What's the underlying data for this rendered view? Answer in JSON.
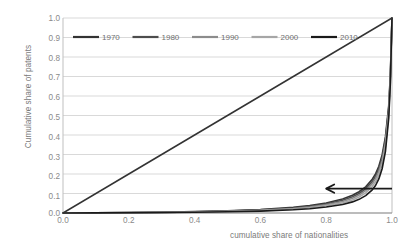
{
  "chart_data": {
    "type": "line",
    "title": "",
    "subtitle": "",
    "xlabel": "cumulative share of nationalities",
    "ylabel": "Cumulative share of patents",
    "xlim": [
      0.0,
      1.0
    ],
    "ylim": [
      0.0,
      1.0
    ],
    "xticks": [
      "0.0",
      "0.2",
      "0.4",
      "0.6",
      "0.8",
      "1.0"
    ],
    "xtick_values": [
      0.0,
      0.2,
      0.4,
      0.6,
      0.8,
      1.0
    ],
    "yticks": [
      "0.0",
      "0.1",
      "0.2",
      "0.3",
      "0.4",
      "0.5",
      "0.6",
      "0.7",
      "0.8",
      "0.9",
      "1.0"
    ],
    "ytick_values": [
      0.0,
      0.1,
      0.2,
      0.3,
      0.4,
      0.5,
      0.6,
      0.7,
      0.8,
      0.9,
      1.0
    ],
    "grid": "horizontal",
    "legend_position": "top-inside",
    "x": [
      0.0,
      0.1,
      0.2,
      0.3,
      0.4,
      0.5,
      0.6,
      0.7,
      0.75,
      0.8,
      0.85,
      0.88,
      0.9,
      0.92,
      0.94,
      0.95,
      0.96,
      0.97,
      0.98,
      0.99,
      0.995,
      1.0
    ],
    "series": [
      {
        "name": "1970",
        "color": "#333333",
        "values": [
          0.0,
          0.001,
          0.002,
          0.004,
          0.007,
          0.011,
          0.018,
          0.029,
          0.038,
          0.051,
          0.072,
          0.091,
          0.109,
          0.134,
          0.173,
          0.201,
          0.24,
          0.298,
          0.39,
          0.55,
          0.71,
          1.0
        ]
      },
      {
        "name": "1980",
        "color": "#4d4d4d",
        "values": [
          0.0,
          0.001,
          0.002,
          0.003,
          0.006,
          0.01,
          0.016,
          0.026,
          0.034,
          0.046,
          0.065,
          0.083,
          0.1,
          0.124,
          0.161,
          0.188,
          0.226,
          0.283,
          0.375,
          0.535,
          0.7,
          1.0
        ]
      },
      {
        "name": "1990",
        "color": "#8c8c8c",
        "values": [
          0.0,
          0.001,
          0.002,
          0.003,
          0.005,
          0.009,
          0.014,
          0.023,
          0.031,
          0.042,
          0.059,
          0.076,
          0.092,
          0.115,
          0.15,
          0.176,
          0.213,
          0.268,
          0.358,
          0.52,
          0.69,
          1.0
        ]
      },
      {
        "name": "2000",
        "color": "#a6a6a6",
        "values": [
          0.0,
          0.0008,
          0.0016,
          0.0027,
          0.0045,
          0.0075,
          0.012,
          0.02,
          0.027,
          0.037,
          0.052,
          0.067,
          0.082,
          0.103,
          0.136,
          0.16,
          0.196,
          0.25,
          0.34,
          0.505,
          0.68,
          1.0
        ]
      },
      {
        "name": "2010",
        "color": "#1a1a1a",
        "values": [
          0.0,
          0.0006,
          0.0013,
          0.0022,
          0.0037,
          0.0061,
          0.0098,
          0.0165,
          0.022,
          0.031,
          0.044,
          0.057,
          0.07,
          0.089,
          0.119,
          0.141,
          0.175,
          0.227,
          0.315,
          0.485,
          0.665,
          1.0
        ]
      }
    ],
    "reference_line": {
      "name": "equality-line",
      "from": [
        0.0,
        0.0
      ],
      "to": [
        1.0,
        1.0
      ],
      "color": "#333333"
    },
    "annotations": [
      {
        "name": "trend-arrow",
        "type": "arrow",
        "direction": "left",
        "from": [
          1.0,
          0.125
        ],
        "to": [
          0.8,
          0.125
        ],
        "color": "#1a1a1a"
      }
    ],
    "legend": [
      {
        "label": "1970",
        "color": "#333333"
      },
      {
        "label": "1980",
        "color": "#4d4d4d"
      },
      {
        "label": "1990",
        "color": "#8c8c8c"
      },
      {
        "label": "2000",
        "color": "#a6a6a6"
      },
      {
        "label": "2010",
        "color": "#1a1a1a"
      }
    ],
    "colors": {
      "grid": "#d9d9d9",
      "axis": "#b3b3b3",
      "text": "#808080",
      "background": "#ffffff"
    }
  }
}
